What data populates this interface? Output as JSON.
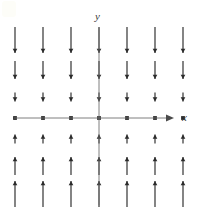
{
  "figure": {
    "title": "",
    "width": 208,
    "height": 216,
    "background": "#ffffff",
    "ink_color": "#2b2b2b",
    "axis_color": "#6f6f6f"
  },
  "axes": {
    "x_label": "x",
    "y_label": "y",
    "x_axis": {
      "y_pixel": 118,
      "x_start": 14,
      "x_end": 172,
      "has_arrowhead": true
    },
    "y_axis": {
      "x_pixel": 99,
      "y_start": 28,
      "y_end": 205,
      "has_arrowhead": false
    },
    "origin": {
      "x": 99,
      "y": 118
    },
    "tick_labels_shown": false
  },
  "chart_data": {
    "type": "scatter",
    "subtype": "direction-field",
    "title": "",
    "xlabel": "x",
    "ylabel": "y",
    "xlim": [
      -3.5,
      3.5
    ],
    "ylim": [
      -3.5,
      3.5
    ],
    "grid": false,
    "legend": null,
    "x": [
      -3,
      -2,
      -1,
      0,
      1,
      2,
      3
    ],
    "y": [
      3,
      2,
      1,
      0,
      -1,
      -2,
      -3
    ],
    "column_pixels": [
      15,
      43,
      71,
      99,
      127,
      155,
      183
    ],
    "row_pixels": [
      40,
      70,
      97,
      118,
      139,
      166,
      194
    ],
    "rows": [
      {
        "y": 3,
        "direction": "down",
        "length": 26,
        "arrow_at": "bottom"
      },
      {
        "y": 2,
        "direction": "down",
        "length": 18,
        "arrow_at": "bottom"
      },
      {
        "y": 1,
        "direction": "down",
        "length": 9,
        "arrow_at": "bottom"
      },
      {
        "y": 0,
        "direction": "none",
        "length": 0,
        "arrow_at": "none"
      },
      {
        "y": -1,
        "direction": "up",
        "length": 9,
        "arrow_at": "top"
      },
      {
        "y": -2,
        "direction": "up",
        "length": 18,
        "arrow_at": "top"
      },
      {
        "y": -3,
        "direction": "up",
        "length": 26,
        "arrow_at": "top"
      }
    ],
    "series": [
      {
        "name": "dy/dt",
        "values": [
          -3,
          -2,
          -1,
          0,
          1,
          2,
          3
        ]
      }
    ]
  }
}
